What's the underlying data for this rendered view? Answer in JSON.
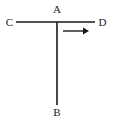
{
  "figure": {
    "width": 113,
    "height": 126,
    "background_color": "#ffffff",
    "stroke_color": "#1a1a1a",
    "label_color": "#1a1a1a"
  },
  "labels": {
    "c": "C",
    "a": "A",
    "d": "D",
    "b": "B"
  },
  "geometry": {
    "horizontal_segment": {
      "name": "segment-CD",
      "x1": 16,
      "y1": 22,
      "x2": 95,
      "y2": 22,
      "stroke_width": 1.6
    },
    "vertical_segment": {
      "name": "segment-AB",
      "x1": 57,
      "y1": 22,
      "x2": 57,
      "y2": 105,
      "stroke_width": 1.6
    },
    "arrow": {
      "name": "motion-arrow-right",
      "shaft_x1": 63,
      "shaft_y": 31,
      "shaft_x2": 83,
      "tip_x": 89,
      "head_half_height": 3.4,
      "stroke_width": 1.4,
      "direction": "right"
    },
    "intersection_point": {
      "x": 57,
      "y": 22
    }
  }
}
